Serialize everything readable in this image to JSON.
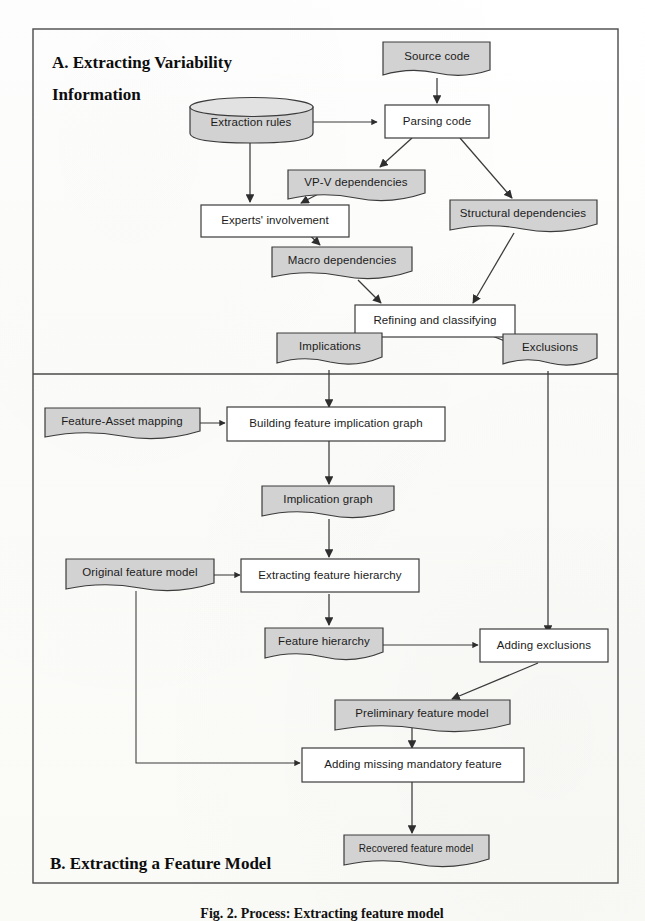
{
  "figure": {
    "caption": "Fig. 2. Process: Extracting feature model",
    "sections": [
      {
        "id": "A",
        "title_line1": "A. Extracting Variability",
        "title_line2": "Information"
      },
      {
        "id": "B",
        "title": "B. Extracting a Feature Model"
      }
    ]
  },
  "colors": {
    "document_fill": "#d2d2d2",
    "process_fill": "#ffffff",
    "stroke": "#3b3b3b",
    "frame_stroke": "#4a4a4a",
    "text": "#1b1b1b"
  },
  "nodes": {
    "source_code": {
      "label": "Source code",
      "shape": "document"
    },
    "extraction_rules": {
      "label": "Extraction rules",
      "shape": "database"
    },
    "parsing_code": {
      "label": "Parsing code",
      "shape": "process"
    },
    "vpv_dependencies": {
      "label": "VP-V dependencies",
      "shape": "document"
    },
    "experts_involvement": {
      "label": "Experts' involvement",
      "shape": "process"
    },
    "structural_dependencies": {
      "label": "Structural dependencies",
      "shape": "document"
    },
    "macro_dependencies": {
      "label": "Macro dependencies",
      "shape": "document"
    },
    "refining_classifying": {
      "label": "Refining and classifying",
      "shape": "process"
    },
    "implications": {
      "label": "Implications",
      "shape": "document"
    },
    "exclusions": {
      "label": "Exclusions",
      "shape": "document"
    },
    "feature_asset_mapping": {
      "label": "Feature-Asset mapping",
      "shape": "document"
    },
    "building_implication_graph": {
      "label": "Building feature implication graph",
      "shape": "process"
    },
    "implication_graph": {
      "label": "Implication graph",
      "shape": "document"
    },
    "original_feature_model": {
      "label": "Original feature model",
      "shape": "document"
    },
    "extracting_feature_hierarchy": {
      "label": "Extracting feature hierarchy",
      "shape": "process"
    },
    "feature_hierarchy": {
      "label": "Feature hierarchy",
      "shape": "document"
    },
    "adding_exclusions": {
      "label": "Adding exclusions",
      "shape": "process"
    },
    "preliminary_feature_model": {
      "label": "Preliminary feature model",
      "shape": "document"
    },
    "adding_missing_mandatory": {
      "label": "Adding missing mandatory feature",
      "shape": "process"
    },
    "recovered_feature_model": {
      "label": "Recovered feature model",
      "shape": "document"
    }
  },
  "edges": [
    {
      "from": "source_code",
      "to": "parsing_code"
    },
    {
      "from": "extraction_rules",
      "to": "parsing_code"
    },
    {
      "from": "extraction_rules",
      "to": "experts_involvement"
    },
    {
      "from": "parsing_code",
      "to": "vpv_dependencies"
    },
    {
      "from": "parsing_code",
      "to": "structural_dependencies"
    },
    {
      "from": "vpv_dependencies",
      "to": "experts_involvement"
    },
    {
      "from": "experts_involvement",
      "to": "macro_dependencies"
    },
    {
      "from": "macro_dependencies",
      "to": "refining_classifying"
    },
    {
      "from": "structural_dependencies",
      "to": "refining_classifying"
    },
    {
      "from": "refining_classifying",
      "to": "implications"
    },
    {
      "from": "refining_classifying",
      "to": "exclusions"
    },
    {
      "from": "implications",
      "to": "building_implication_graph"
    },
    {
      "from": "exclusions",
      "to": "adding_exclusions"
    },
    {
      "from": "feature_asset_mapping",
      "to": "building_implication_graph"
    },
    {
      "from": "building_implication_graph",
      "to": "implication_graph"
    },
    {
      "from": "implication_graph",
      "to": "extracting_feature_hierarchy"
    },
    {
      "from": "original_feature_model",
      "to": "extracting_feature_hierarchy"
    },
    {
      "from": "original_feature_model",
      "to": "adding_missing_mandatory"
    },
    {
      "from": "extracting_feature_hierarchy",
      "to": "feature_hierarchy"
    },
    {
      "from": "feature_hierarchy",
      "to": "adding_exclusions"
    },
    {
      "from": "adding_exclusions",
      "to": "preliminary_feature_model"
    },
    {
      "from": "preliminary_feature_model",
      "to": "adding_missing_mandatory"
    },
    {
      "from": "adding_missing_mandatory",
      "to": "recovered_feature_model"
    }
  ]
}
